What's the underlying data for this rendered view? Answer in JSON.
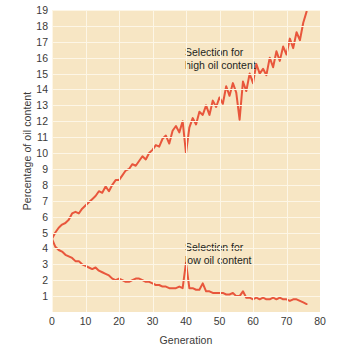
{
  "chart_data": {
    "type": "line",
    "title": "",
    "xlabel": "Generation",
    "ylabel": "Percentage of oil content",
    "xlim": [
      0,
      80
    ],
    "ylim": [
      0,
      19
    ],
    "grid": true,
    "legend_position": "inline-annotations",
    "x_ticks": [
      "0",
      "10",
      "20",
      "30",
      "40",
      "50",
      "60",
      "70",
      "80"
    ],
    "y_ticks": [
      "1",
      "2",
      "3",
      "4",
      "5",
      "6",
      "7",
      "8",
      "9",
      "10",
      "11",
      "12",
      "13",
      "14",
      "15",
      "16",
      "17",
      "18",
      "19"
    ],
    "annotations": [
      {
        "id": "high",
        "text_line1": "Selection for",
        "text_line2": "high oil content",
        "x": 44,
        "y": 16.2
      },
      {
        "id": "low",
        "text_line1": "Selection for",
        "text_line2": "low oil content",
        "x": 44,
        "y": 3.6
      }
    ],
    "line_color": "#e8563c",
    "plot_background": "#f7e6c4",
    "gridline_color": "#fdf6e6",
    "series": [
      {
        "name": "Selection for high oil content",
        "color": "#e8563c",
        "x": [
          0,
          1,
          2,
          3,
          4,
          5,
          6,
          7,
          8,
          9,
          10,
          11,
          12,
          13,
          14,
          15,
          16,
          17,
          18,
          19,
          20,
          21,
          22,
          23,
          24,
          25,
          26,
          27,
          28,
          29,
          30,
          31,
          32,
          33,
          34,
          35,
          36,
          37,
          38,
          39,
          40,
          41,
          42,
          43,
          44,
          45,
          46,
          47,
          48,
          49,
          50,
          51,
          52,
          53,
          54,
          55,
          56,
          57,
          58,
          59,
          60,
          61,
          62,
          63,
          64,
          65,
          66,
          67,
          68,
          69,
          70,
          71,
          72,
          73,
          74,
          75,
          76
        ],
        "values": [
          4.6,
          5.0,
          5.3,
          5.5,
          5.6,
          5.8,
          6.2,
          6.3,
          6.2,
          6.5,
          6.7,
          6.9,
          7.1,
          7.3,
          7.6,
          7.5,
          7.9,
          7.6,
          8.0,
          8.3,
          8.3,
          8.6,
          8.9,
          9.0,
          9.3,
          9.2,
          9.5,
          9.8,
          9.6,
          10.0,
          10.2,
          10.5,
          10.4,
          10.9,
          11.1,
          10.6,
          11.4,
          11.7,
          11.3,
          12.0,
          10.0,
          11.6,
          12.2,
          11.8,
          12.6,
          12.4,
          13.0,
          12.4,
          13.3,
          12.9,
          13.5,
          13.1,
          14.2,
          13.6,
          14.4,
          13.8,
          12.1,
          14.5,
          13.9,
          15.0,
          14.4,
          15.6,
          15.0,
          15.3,
          14.9,
          16.0,
          15.4,
          16.4,
          15.8,
          16.7,
          16.2,
          17.2,
          16.6,
          17.6,
          17.1,
          18.2,
          18.9
        ]
      },
      {
        "name": "Selection for low oil content",
        "color": "#e8563c",
        "x": [
          0,
          1,
          2,
          3,
          4,
          5,
          6,
          7,
          8,
          9,
          10,
          11,
          12,
          13,
          14,
          15,
          16,
          17,
          18,
          19,
          20,
          21,
          22,
          23,
          24,
          25,
          26,
          27,
          28,
          29,
          30,
          31,
          32,
          33,
          34,
          35,
          36,
          37,
          38,
          39,
          40,
          41,
          42,
          43,
          44,
          45,
          46,
          47,
          48,
          49,
          50,
          51,
          52,
          53,
          54,
          55,
          56,
          57,
          58,
          59,
          60,
          61,
          62,
          63,
          64,
          65,
          66,
          67,
          68,
          69,
          70,
          71,
          72,
          73,
          74,
          75,
          76
        ],
        "values": [
          4.6,
          4.1,
          3.9,
          3.8,
          3.6,
          3.5,
          3.4,
          3.2,
          3.2,
          3.0,
          2.9,
          2.8,
          2.7,
          2.8,
          2.6,
          2.5,
          2.4,
          2.3,
          2.1,
          2.0,
          2.1,
          2.0,
          1.9,
          1.9,
          2.0,
          2.1,
          2.1,
          2.0,
          1.9,
          1.9,
          1.8,
          1.7,
          1.7,
          1.6,
          1.6,
          1.5,
          1.5,
          1.5,
          1.6,
          1.5,
          3.1,
          1.5,
          1.5,
          1.4,
          1.4,
          1.8,
          1.3,
          1.3,
          1.2,
          1.2,
          1.2,
          1.2,
          1.1,
          1.1,
          1.2,
          1.0,
          1.0,
          1.3,
          0.9,
          0.9,
          0.8,
          0.9,
          0.8,
          0.9,
          0.8,
          0.8,
          0.9,
          0.8,
          0.9,
          0.8,
          0.8,
          0.7,
          0.8,
          0.8,
          0.7,
          0.6,
          0.5
        ]
      }
    ]
  }
}
